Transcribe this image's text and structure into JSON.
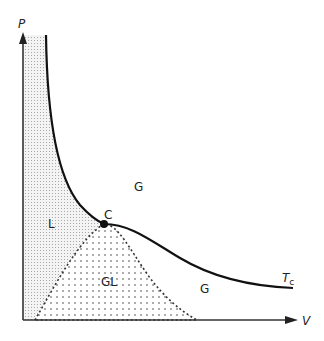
{
  "axes": {
    "y_label": "P",
    "x_label": "V"
  },
  "regions": {
    "liquid": "L",
    "gas_upper": "G",
    "gas_lower": "G",
    "coexistence": "GL"
  },
  "critical_point": {
    "label": "C"
  },
  "isotherm": {
    "label_main": "T",
    "label_sub": "c"
  },
  "colors": {
    "line": "#111111",
    "liquid_fill": "#d8d8d8",
    "dots": "#444444",
    "background": "#ffffff"
  }
}
